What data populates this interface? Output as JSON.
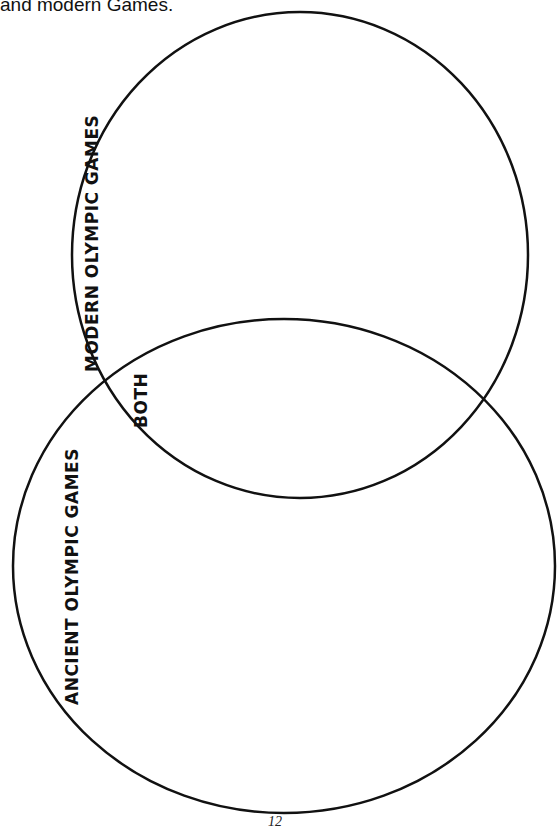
{
  "caption": "and modern Games.",
  "diagram": {
    "type": "venn",
    "circles": [
      {
        "label": "MODERN OLYMPIC GAMES",
        "cx": 300,
        "cy": 255,
        "rx": 228,
        "ry": 243
      },
      {
        "label": "ANCIENT OLYMPIC GAMES",
        "cx": 284,
        "cy": 566,
        "rx": 271,
        "ry": 247
      }
    ],
    "overlap_label": "BOTH",
    "stroke_color": "#111111"
  },
  "page_number": "12"
}
